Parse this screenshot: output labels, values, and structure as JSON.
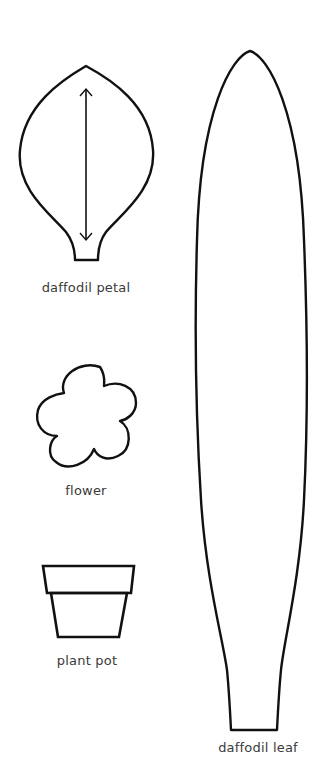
{
  "templates": [
    {
      "id": "petal",
      "label": "daffodil petal"
    },
    {
      "id": "flower",
      "label": "flower"
    },
    {
      "id": "pot",
      "label": "plant pot"
    },
    {
      "id": "leaf",
      "label": "daffodil leaf"
    }
  ],
  "colors": {
    "stroke": "#111111",
    "label": "#3a3a3a",
    "background": "#ffffff"
  }
}
